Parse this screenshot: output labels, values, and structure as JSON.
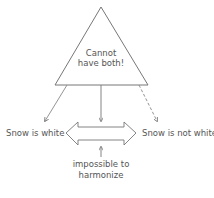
{
  "diagram": {
    "triangle": {
      "lines": [
        "Cannot",
        "have both!"
      ]
    },
    "left_claim": "Snow is white",
    "right_claim": "Snow is not white",
    "bottom_note": {
      "lines": [
        "impossible to",
        "harmonize"
      ]
    },
    "colors": {
      "stroke": "#777777",
      "text": "#555555",
      "background": "#ffffff"
    }
  }
}
